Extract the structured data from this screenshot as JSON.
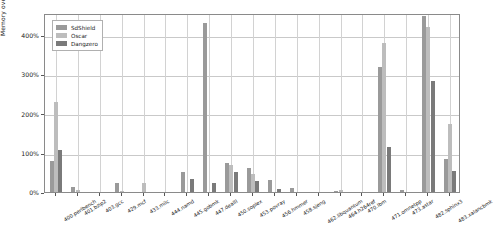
{
  "chart_data": {
    "type": "bar",
    "title": "",
    "xlabel": "",
    "ylabel": "Memory overhead",
    "ylim": [
      0,
      455
    ],
    "grid": true,
    "legend_position": "upper-left",
    "ytick_labels": [
      "0%",
      "100%",
      "200%",
      "300%",
      "400%"
    ],
    "ytick_values": [
      0,
      100,
      200,
      300,
      400
    ],
    "categories": [
      "400.perlbench",
      "401.bzip2",
      "403.gcc",
      "429.mcf",
      "433.milc",
      "444.namd",
      "445.gobmk",
      "447.dealII",
      "450.soplex",
      "453.povray",
      "456.hmmer",
      "458.sjeng",
      "462.libquantum",
      "464.h264ref",
      "470.lbm",
      "471.omnetpp",
      "473.astar",
      "482.sphinx3",
      "483.xalancbmk"
    ],
    "series": [
      {
        "name": "SdShield",
        "color": "#9a9a9a",
        "values": [
          79,
          12,
          0,
          22,
          0,
          0,
          52,
          430,
          75,
          61,
          30,
          11,
          0,
          3,
          0,
          318,
          4,
          447,
          83
        ]
      },
      {
        "name": "Oscar",
        "color": "#bdbdbd",
        "values": [
          229,
          4,
          0,
          2,
          22,
          0,
          0,
          0,
          68,
          45,
          0,
          0,
          0,
          5,
          0,
          380,
          0,
          419,
          174
        ]
      },
      {
        "name": "Dangzero",
        "color": "#7a7a7a",
        "values": [
          106,
          0,
          0,
          0,
          0,
          0,
          34,
          23,
          52,
          28,
          7,
          0,
          0,
          0,
          0,
          115,
          0,
          283,
          53
        ]
      }
    ]
  },
  "legend": {
    "items": [
      {
        "label": "SdShield",
        "color": "#9a9a9a"
      },
      {
        "label": "Oscar",
        "color": "#bdbdbd"
      },
      {
        "label": "Dangzero",
        "color": "#7a7a7a"
      }
    ]
  }
}
